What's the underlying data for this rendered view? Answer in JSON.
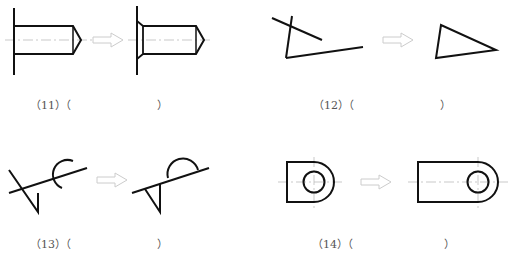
{
  "colors": {
    "stroke": "#111111",
    "centerline": "#bbbbbb",
    "arrow": "#cccccc",
    "label": "#555555"
  },
  "problems": [
    {
      "id": "11",
      "label_open": "（11）（",
      "label_close": "）",
      "description": "bolt/pin shaft against wall, before and after chamfer correction"
    },
    {
      "id": "12",
      "label_open": "（12）（",
      "label_close": "）",
      "description": "three crossing lines trimmed into triangle"
    },
    {
      "id": "13",
      "label_open": "（13）（",
      "label_close": "）",
      "description": "line with open arc and V, trimmed to semicircle and triangle"
    },
    {
      "id": "14",
      "label_open": "（14）（",
      "label_close": "）",
      "description": "D-shaped plate with hole, stretched longer"
    }
  ]
}
